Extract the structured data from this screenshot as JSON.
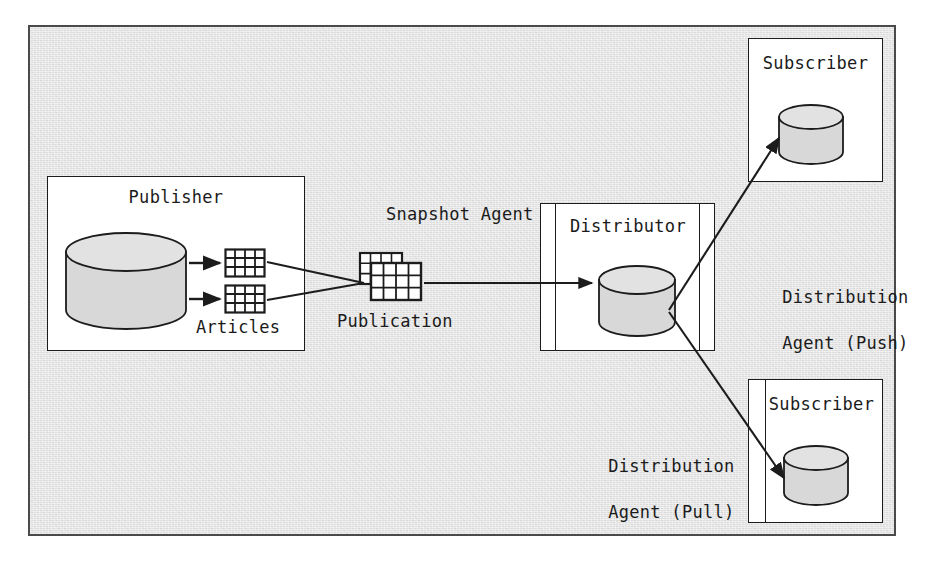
{
  "diagram": {
    "background_color": "#dedede",
    "frame_border_color": "#4a4a4a",
    "box_fill": "#ffffff",
    "line_color": "#1c1c1c",
    "cylinder_fill": "#d8d8d8",
    "nodes": {
      "publisher": {
        "label": "Publisher"
      },
      "articles": {
        "label": "Articles",
        "count": 2
      },
      "publication": {
        "label": "Publication"
      },
      "snapshot_agent": {
        "label": "Snapshot Agent"
      },
      "distributor": {
        "label": "Distributor"
      },
      "subscriber_push": {
        "label": "Subscriber"
      },
      "subscriber_pull": {
        "label": "Subscriber"
      },
      "distribution_agent_push": {
        "line1": "Distribution",
        "line2": "Agent (Push)"
      },
      "distribution_agent_pull": {
        "line1": "Distribution",
        "line2": "Agent (Pull)"
      }
    }
  }
}
